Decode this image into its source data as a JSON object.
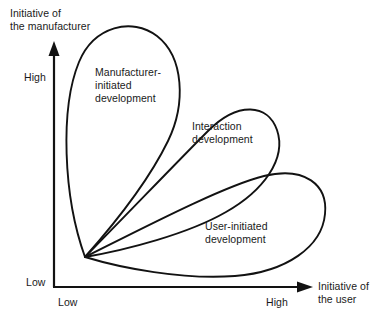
{
  "figure": {
    "type": "conceptual-diagram",
    "background_color": "#ffffff",
    "line_color": "#121212"
  },
  "axes": {
    "y": {
      "title_line1": "Initiative of",
      "title_line2": "the manufacturer",
      "low_label": "Low",
      "high_label": "High",
      "arrow": "up-arrow-icon"
    },
    "x": {
      "title_line1": "Initiative of",
      "title_line2": "the user",
      "low_label": "Low",
      "high_label": "High",
      "arrow": "right-arrow-icon"
    }
  },
  "regions": [
    {
      "id": "manufacturer-initiated",
      "label_line1": "Manufacturer-",
      "label_line2": "initiated",
      "label_line3": "development",
      "orientation": "high-manufacturer-low-user"
    },
    {
      "id": "interaction",
      "label_line1": "Interaction",
      "label_line2": "development",
      "label_line3": "",
      "orientation": "high-manufacturer-high-user"
    },
    {
      "id": "user-initiated",
      "label_line1": "User-initiated",
      "label_line2": "development",
      "label_line3": "",
      "orientation": "low-manufacturer-high-user"
    }
  ]
}
